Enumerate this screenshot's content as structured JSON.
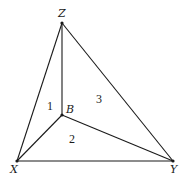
{
  "diagram": {
    "vertices": [
      {
        "id": "Z",
        "label": "Z",
        "x": 62,
        "y": 23
      },
      {
        "id": "B",
        "label": "B",
        "x": 62,
        "y": 115
      },
      {
        "id": "X",
        "label": "X",
        "x": 17,
        "y": 161
      },
      {
        "id": "Y",
        "label": "Y",
        "x": 173,
        "y": 161
      }
    ],
    "edges": [
      {
        "from": "Z",
        "to": "X"
      },
      {
        "from": "Z",
        "to": "Y"
      },
      {
        "from": "X",
        "to": "Y"
      },
      {
        "from": "Z",
        "to": "B"
      },
      {
        "from": "B",
        "to": "X"
      },
      {
        "from": "B",
        "to": "Y"
      }
    ],
    "regions": [
      {
        "id": "region-1",
        "label": "1"
      },
      {
        "id": "region-2",
        "label": "2"
      },
      {
        "id": "region-3",
        "label": "3"
      }
    ],
    "labels": {
      "Z": "Z",
      "B": "B",
      "X": "X",
      "Y": "Y",
      "r1": "1",
      "r2": "2",
      "r3": "3"
    }
  }
}
